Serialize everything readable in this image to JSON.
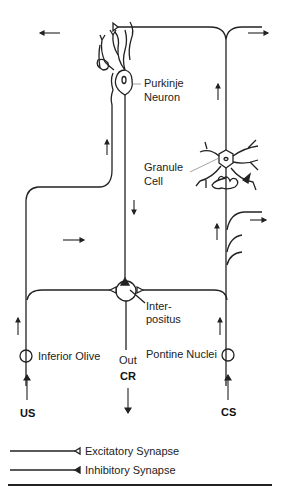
{
  "diagram": {
    "labels": {
      "purkinje_1": "Purkinje",
      "purkinje_2": "Neuron",
      "granule_1": "Granule",
      "granule_2": "Cell",
      "interpositus_1": "Inter-",
      "interpositus_2": "positus",
      "inferior_olive": "Inferior Olive",
      "pontine_nuclei": "Pontine Nuclei",
      "out": "Out",
      "cr": "CR",
      "us": "US",
      "cs": "CS"
    },
    "legend": {
      "excitatory": "Excitatory Synapse",
      "inhibitory": "Inhibitory Synapse"
    },
    "colors": {
      "line": "#222222",
      "background": "#ffffff"
    }
  }
}
